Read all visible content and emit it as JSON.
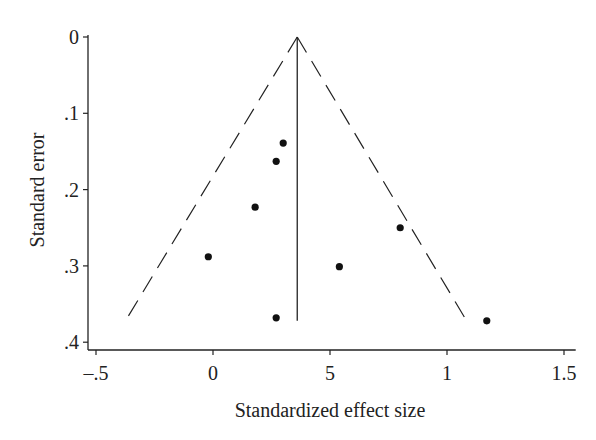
{
  "chart_data": {
    "type": "scatter",
    "subtype": "funnel-plot",
    "title": "",
    "xlabel": "Standardized effect size",
    "ylabel": "Standard error",
    "xlim": [
      -0.55,
      1.55
    ],
    "ylim": [
      0.4,
      0
    ],
    "y_inverted": true,
    "grid": false,
    "x_ticks": [
      -0.5,
      0,
      0.5,
      1,
      1.5
    ],
    "x_tick_labels": [
      "–.5",
      "0",
      "5",
      "1",
      "1.5"
    ],
    "y_ticks": [
      0,
      0.1,
      0.2,
      0.3,
      0.4
    ],
    "y_tick_labels": [
      "0",
      ".1",
      ".2",
      ".3",
      ".4"
    ],
    "pooled_effect": 0.36,
    "funnel_limits": {
      "style": "dashed",
      "apex": [
        0.36,
        0
      ],
      "left_end": [
        -0.37,
        0.37
      ],
      "right_end": [
        1.08,
        0.37
      ]
    },
    "points": [
      {
        "x": 0.3,
        "y": 0.139
      },
      {
        "x": 0.27,
        "y": 0.163
      },
      {
        "x": 0.18,
        "y": 0.223
      },
      {
        "x": -0.02,
        "y": 0.288
      },
      {
        "x": 0.8,
        "y": 0.25
      },
      {
        "x": 0.54,
        "y": 0.301
      },
      {
        "x": 0.27,
        "y": 0.368
      },
      {
        "x": 1.17,
        "y": 0.372
      }
    ]
  },
  "colors": {
    "ink": "#222222",
    "background": "#ffffff"
  }
}
